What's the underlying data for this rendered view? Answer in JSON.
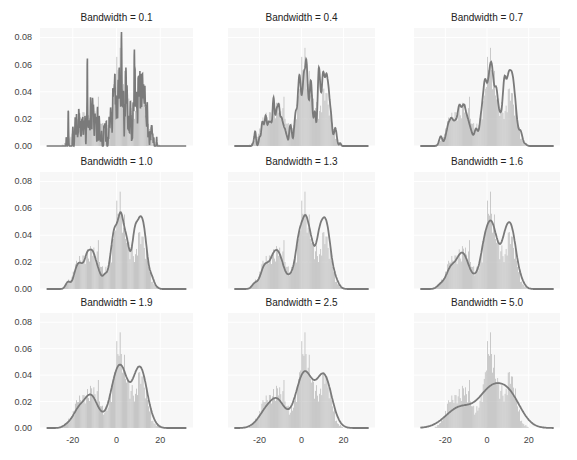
{
  "figure": {
    "panel_titles": [
      "Bandwidth = 0.1",
      "Bandwidth = 0.4",
      "Bandwidth = 0.7",
      "Bandwidth = 1.0",
      "Bandwidth = 1.3",
      "Bandwidth = 1.6",
      "Bandwidth = 1.9",
      "Bandwidth = 2.5",
      "Bandwidth = 5.0"
    ],
    "y_tick_labels": [
      "0.00",
      "0.02",
      "0.04",
      "0.06",
      "0.08"
    ],
    "x_tick_labels": [
      "-20",
      "0",
      "20"
    ],
    "colors": {
      "background": "#f7f7f7",
      "grid": "#ffffff",
      "bars": "#b0b0b0",
      "bar_edge": "#ffffff",
      "curve": "#7a7a7a"
    }
  },
  "chart_data": {
    "type": "histogram+kde",
    "title": "",
    "layout": "3x3 grid, shared axes",
    "xlabel": "",
    "ylabel": "",
    "xlim": [
      -35,
      35
    ],
    "ylim": [
      0,
      0.087
    ],
    "x_ticks": [
      -20,
      0,
      20
    ],
    "y_ticks": [
      0.0,
      0.02,
      0.04,
      0.06,
      0.08
    ],
    "grid": true,
    "bandwidths": [
      0.1,
      0.4,
      0.7,
      1.0,
      1.3,
      1.6,
      1.9,
      2.5,
      5.0
    ],
    "histogram": {
      "bin_width": 1,
      "bin_starts": [
        -25,
        -24,
        -23,
        -22,
        -21,
        -20,
        -19,
        -18,
        -17,
        -16,
        -15,
        -14,
        -13,
        -12,
        -11,
        -10,
        -9,
        -8,
        -7,
        -6,
        -5,
        -4,
        -3,
        -2,
        -1,
        0,
        1,
        2,
        3,
        4,
        5,
        6,
        7,
        8,
        9,
        10,
        11,
        12,
        13,
        14,
        15,
        16,
        17,
        18,
        19,
        20
      ],
      "density": [
        0.001,
        0.002,
        0.004,
        0.006,
        0.008,
        0.012,
        0.018,
        0.022,
        0.021,
        0.023,
        0.022,
        0.025,
        0.024,
        0.028,
        0.03,
        0.022,
        0.031,
        0.02,
        0.015,
        0.012,
        0.014,
        0.018,
        0.024,
        0.032,
        0.048,
        0.056,
        0.066,
        0.05,
        0.047,
        0.04,
        0.033,
        0.027,
        0.028,
        0.022,
        0.03,
        0.038,
        0.04,
        0.033,
        0.026,
        0.02,
        0.012,
        0.006,
        0.003,
        0.002,
        0.001,
        0.0
      ]
    },
    "kde_peaks": [
      {
        "bandwidth": 0.1,
        "max_density": 0.084,
        "modes_x": [
          -11,
          1,
          10
        ]
      },
      {
        "bandwidth": 0.4,
        "max_density": 0.064,
        "modes_x": [
          -11,
          1,
          10
        ]
      },
      {
        "bandwidth": 0.7,
        "max_density": 0.062,
        "modes_x": [
          -11,
          1,
          10
        ]
      },
      {
        "bandwidth": 1.0,
        "max_density": 0.057,
        "modes_x": [
          -11,
          1,
          10
        ]
      },
      {
        "bandwidth": 1.3,
        "max_density": 0.055,
        "modes_x": [
          -11,
          1,
          10
        ]
      },
      {
        "bandwidth": 1.6,
        "max_density": 0.051,
        "modes_x": [
          -11,
          1,
          10
        ]
      },
      {
        "bandwidth": 1.9,
        "max_density": 0.048,
        "modes_x": [
          -11,
          1,
          10
        ]
      },
      {
        "bandwidth": 2.5,
        "max_density": 0.043,
        "modes_x": [
          -11,
          1,
          10
        ]
      },
      {
        "bandwidth": 5.0,
        "max_density": 0.034,
        "modes_x": [
          2
        ]
      }
    ]
  }
}
